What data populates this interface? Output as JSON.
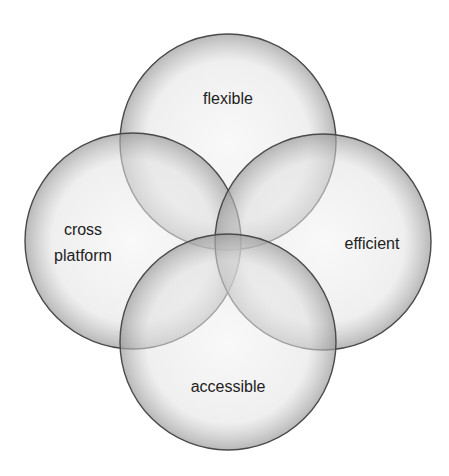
{
  "diagram": {
    "type": "venn",
    "sets": [
      {
        "id": "flexible",
        "label_lines": [
          "flexible"
        ]
      },
      {
        "id": "cross-platform",
        "label_lines": [
          "cross",
          "platform"
        ]
      },
      {
        "id": "efficient",
        "label_lines": [
          "efficient"
        ]
      },
      {
        "id": "accessible",
        "label_lines": [
          "accessible"
        ]
      }
    ],
    "colors": {
      "fill_center": "#f2f2f2",
      "fill_edge": "#b8b8b8",
      "stroke": "#4a4a4a",
      "text": "#222222"
    }
  }
}
